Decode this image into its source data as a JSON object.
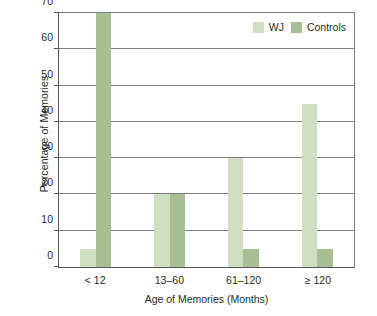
{
  "chart_data": {
    "type": "bar",
    "title": "",
    "subtitle": "",
    "xlabel": "Age of Memories (Months)",
    "ylabel": "Percentage of Memories",
    "categories": [
      "< 12",
      "13–60",
      "61–120",
      "≥ 120"
    ],
    "series": [
      {
        "name": "WJ",
        "color": "#cfdfc2",
        "values": [
          5,
          20,
          30,
          45
        ]
      },
      {
        "name": "Controls",
        "color": "#a8bf93",
        "values": [
          70,
          20,
          5,
          5
        ]
      }
    ],
    "ylim": [
      0,
      70
    ],
    "yticks": [
      0,
      10,
      20,
      30,
      40,
      50,
      60,
      70
    ],
    "ytick_labels": [
      "0",
      "10",
      "20",
      "30",
      "40",
      "50",
      "60",
      "70"
    ],
    "grid": "horizontal",
    "legend_position": "top-right",
    "legend": [
      {
        "label": "WJ",
        "color": "#cfdfc2"
      },
      {
        "label": "Controls",
        "color": "#a8bf93"
      }
    ]
  }
}
